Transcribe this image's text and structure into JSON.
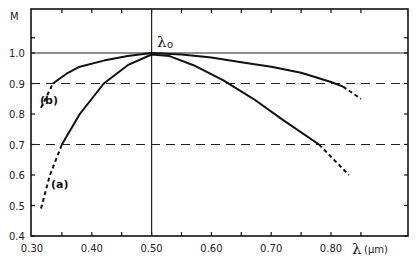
{
  "chart_data": {
    "type": "line",
    "title": "",
    "xlabel": "λ (μm)",
    "ylabel": "M",
    "xlim": [
      0.3,
      0.87
    ],
    "ylim": [
      0.4,
      1.1
    ],
    "x_ticks": [
      "0.30",
      "0.40",
      "0.50",
      "0.60",
      "0.70",
      "0.80"
    ],
    "y_ticks": [
      "0.4",
      "0.5",
      "0.6",
      "0.7",
      "0.8",
      "0.9",
      "1.0"
    ],
    "grid": false,
    "reference_lines": [
      {
        "type": "horizontal",
        "y": 1.0,
        "style": "solid"
      },
      {
        "type": "horizontal",
        "y": 0.9,
        "style": "dashed"
      },
      {
        "type": "horizontal",
        "y": 0.7,
        "style": "dashed"
      },
      {
        "type": "vertical",
        "x": 0.5,
        "style": "solid",
        "label": "λo"
      }
    ],
    "annotations": [
      "λo",
      "(a)",
      "(b)"
    ],
    "series": [
      {
        "name": "(b)",
        "solid": {
          "x": [
            0.335,
            0.36,
            0.38,
            0.42,
            0.46,
            0.5,
            0.55,
            0.6,
            0.65,
            0.7,
            0.75,
            0.8,
            0.82
          ],
          "y": [
            0.9,
            0.935,
            0.955,
            0.975,
            0.99,
            1.0,
            0.995,
            0.985,
            0.97,
            0.955,
            0.935,
            0.905,
            0.89
          ]
        },
        "dashed_left": {
          "x": [
            0.315,
            0.325,
            0.335
          ],
          "y": [
            0.82,
            0.86,
            0.9
          ]
        },
        "dashed_right": {
          "x": [
            0.82,
            0.85
          ],
          "y": [
            0.89,
            0.85
          ]
        }
      },
      {
        "name": "(a)",
        "solid": {
          "x": [
            0.35,
            0.38,
            0.42,
            0.46,
            0.5,
            0.53,
            0.57,
            0.62,
            0.67,
            0.72,
            0.78
          ],
          "y": [
            0.7,
            0.8,
            0.9,
            0.96,
            0.995,
            0.99,
            0.96,
            0.91,
            0.85,
            0.78,
            0.7
          ]
        },
        "dashed_left": {
          "x": [
            0.315,
            0.33,
            0.35
          ],
          "y": [
            0.49,
            0.6,
            0.7
          ]
        },
        "dashed_right": {
          "x": [
            0.78,
            0.83
          ],
          "y": [
            0.7,
            0.6
          ]
        }
      }
    ]
  },
  "labels": {
    "y_axis": "M",
    "x_axis_symbol": "λ",
    "x_axis_unit": "(μm)",
    "lambda0": "λ",
    "lambda0_sub": "o",
    "curve_a": "(a)",
    "curve_b": "(b)"
  }
}
